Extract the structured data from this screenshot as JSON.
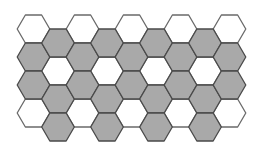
{
  "diagram": {
    "type": "hexagon-tessellation",
    "orientation": "flat-top",
    "columns": 9,
    "rows_per_column": 4,
    "colors": {
      "filled": "#a9a9a9",
      "empty": "#ffffff",
      "stroke": "#4a4a4a",
      "empty_stroke": "#6a6a6a",
      "background": "#ffffff"
    },
    "grid": [
      [
        "white",
        "gray",
        "gray",
        "white"
      ],
      [
        "gray",
        "white",
        "gray",
        "gray"
      ],
      [
        "white",
        "gray",
        "gray",
        "white"
      ],
      [
        "gray",
        "white",
        "gray",
        "gray"
      ],
      [
        "white",
        "gray",
        "gray",
        "white"
      ],
      [
        "gray",
        "white",
        "gray",
        "gray"
      ],
      [
        "white",
        "gray",
        "gray",
        "white"
      ],
      [
        "gray",
        "white",
        "gray",
        "gray"
      ],
      [
        "white",
        "gray",
        "gray",
        "white"
      ]
    ]
  }
}
